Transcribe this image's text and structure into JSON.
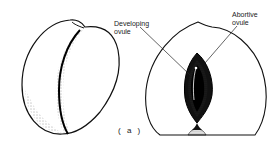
{
  "figure": {
    "labels": {
      "developing_line1": "Developing",
      "developing_line2": "ovule",
      "abortive_line1": "Abortive",
      "abortive_line2": "ovule"
    },
    "caption": "( a )"
  }
}
